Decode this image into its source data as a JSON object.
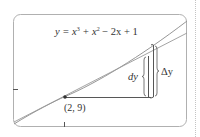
{
  "figure": {
    "equation": {
      "prefix": "y = x",
      "exp1": "3",
      "mid": " + x",
      "exp2": "2",
      "suffix": " − 2x + 1"
    },
    "point_label": "(2, 9)",
    "dy_label": "dy",
    "delta_y_label": "Δy",
    "colors": {
      "frame": "#b0b0b0",
      "curve": "#8a8a8a",
      "tangent": "#9a9a9a",
      "bars": "#555555",
      "point": "#333333",
      "dotted_rule": "#c0c0c0"
    }
  }
}
